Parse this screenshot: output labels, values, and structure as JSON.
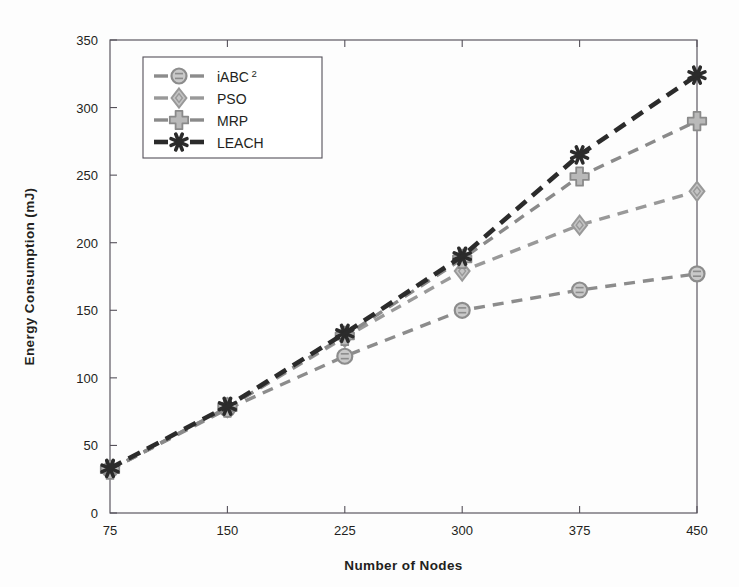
{
  "chart_data": {
    "type": "line",
    "title": "",
    "xlabel": "Number of Nodes",
    "ylabel": "Energy Consumption (mJ)",
    "x": [
      75,
      150,
      225,
      300,
      375,
      450
    ],
    "xtick_labels": [
      "75",
      "150",
      "225",
      "300",
      "375",
      "450"
    ],
    "ytick_labels": [
      "0",
      "50",
      "100",
      "150",
      "200",
      "250",
      "300",
      "350"
    ],
    "yticks": [
      0,
      50,
      100,
      150,
      200,
      250,
      300,
      350
    ],
    "xlim": [
      75,
      450
    ],
    "ylim": [
      0,
      350
    ],
    "grid": false,
    "legend_position": "upper left inside",
    "series": [
      {
        "name": "iABC²",
        "label_base": "iABC",
        "label_sup": "2",
        "marker": "circle",
        "color": "#8c8c8c",
        "line_style": "dashed",
        "values": [
          32,
          77,
          116,
          150,
          165,
          177
        ]
      },
      {
        "name": "PSO",
        "label_base": "PSO",
        "label_sup": "",
        "marker": "diamond",
        "color": "#999999",
        "line_style": "dashed",
        "values": [
          32,
          78,
          130,
          179,
          213,
          238
        ]
      },
      {
        "name": "MRP",
        "label_base": "MRP",
        "label_sup": "",
        "marker": "plus",
        "color": "#8a8a8a",
        "line_style": "dashed",
        "values": [
          32,
          78,
          131,
          188,
          249,
          290
        ]
      },
      {
        "name": "LEACH",
        "label_base": "LEACH",
        "label_sup": "",
        "marker": "asterisk",
        "color": "#2b2b2b",
        "line_style": "dashed",
        "values": [
          33,
          79,
          133,
          190,
          265,
          324
        ]
      }
    ]
  },
  "figure": {
    "background_color": "#fdfdfd",
    "frame_color": "#55515a"
  }
}
